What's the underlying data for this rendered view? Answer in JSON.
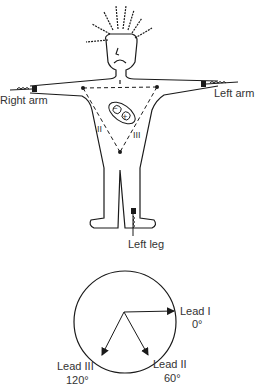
{
  "figure": {
    "body_labels": {
      "right_arm": "Right arm",
      "left_arm": "Left arm",
      "left_leg": "Left leg"
    },
    "triangle_leads": {
      "lead_1": "I",
      "lead_2": "II",
      "lead_3": "III"
    },
    "heart_poles": {
      "negative": "−",
      "positive": "+"
    },
    "colors": {
      "stroke": "#1a1a1a",
      "text": "#333333",
      "background": "#ffffff"
    }
  },
  "axis_diagram": {
    "leads": [
      {
        "name": "Lead I",
        "angle": "0°"
      },
      {
        "name": "Lead II",
        "angle": "60°"
      },
      {
        "name": "Lead III",
        "angle": "120°"
      }
    ]
  }
}
